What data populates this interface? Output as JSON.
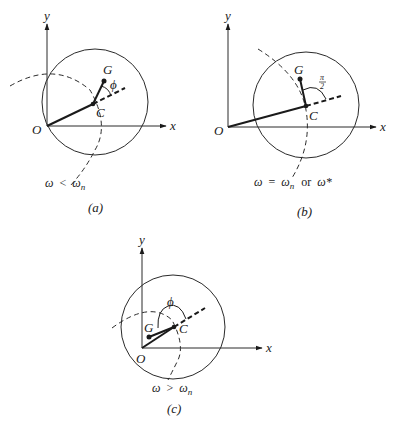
{
  "figure": {
    "panels": [
      {
        "id": "a",
        "caption": "(a)",
        "condition": "ω < ωn",
        "condition_parts": {
          "lhs": "ω",
          "op": "<",
          "rhs": "ω",
          "sub": "n"
        },
        "labels": {
          "y": "y",
          "x": "x",
          "origin": "O",
          "center": "C",
          "gravity": "G",
          "angle": "ϕ"
        }
      },
      {
        "id": "b",
        "caption": "(b)",
        "condition": "ω = ωn or ω*",
        "condition_parts": {
          "lhs": "ω",
          "op": "=",
          "rhs": "ω",
          "sub": "n",
          "or": "or",
          "alt": "ω*"
        },
        "labels": {
          "y": "y",
          "x": "x",
          "origin": "O",
          "center": "C",
          "gravity": "G",
          "angle_num": "π",
          "angle_den": "2"
        }
      },
      {
        "id": "c",
        "caption": "(c)",
        "condition": "ω > ωn",
        "condition_parts": {
          "lhs": "ω",
          "op": ">",
          "rhs": "ω",
          "sub": "n"
        },
        "labels": {
          "y": "y",
          "x": "x",
          "origin": "O",
          "center": "C",
          "gravity": "G",
          "angle": "ϕ"
        }
      }
    ]
  }
}
